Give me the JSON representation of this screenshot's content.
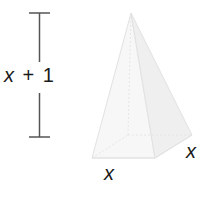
{
  "diagram": {
    "height_label": {
      "var": "x",
      "op": "+",
      "num": "1"
    },
    "base_front_label": "x",
    "base_side_label": "x",
    "colors": {
      "text": "#1a1a1a",
      "dimension_line": "#555555",
      "pyramid_edge": "#dddddd",
      "pyramid_face": "#f6f6f6"
    }
  }
}
